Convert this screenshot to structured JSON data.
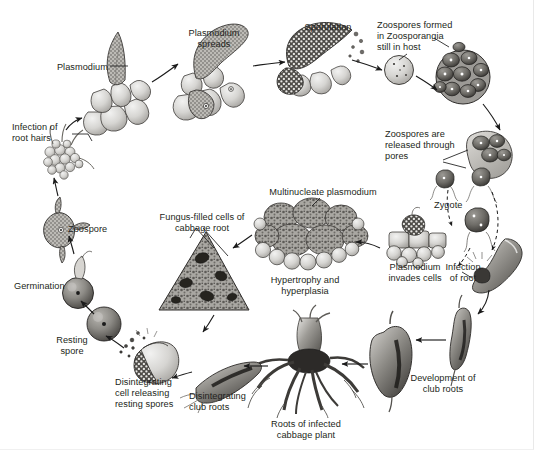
{
  "figure": {
    "background_color": "#ffffff",
    "text_color": "#231f20",
    "width": 534,
    "height": 450
  },
  "labels": [
    {
      "id": "plasmodium",
      "text": "Plasmodium",
      "x": 44,
      "y": 62,
      "w": 64,
      "align": "right"
    },
    {
      "id": "plasmodium-spreads",
      "text": "Plasmodium\nspreads",
      "x": 177,
      "y": 28,
      "w": 74,
      "align": "center"
    },
    {
      "id": "sporulation",
      "text": "Sporulation",
      "x": 298,
      "y": 22,
      "w": 60,
      "align": "center"
    },
    {
      "id": "zoospores-formed",
      "text": "Zoospores formed\nin Zoosporangia\nstill in host",
      "x": 377,
      "y": 20,
      "w": 88,
      "align": "left"
    },
    {
      "id": "infection-of-root-hairs",
      "text": "Infection of\nroot hairs",
      "x": 12,
      "y": 122,
      "w": 58,
      "align": "left"
    },
    {
      "id": "zoospores-released",
      "text": "Zoospores are\nreleased through\npores",
      "x": 385,
      "y": 129,
      "w": 90,
      "align": "left"
    },
    {
      "id": "zygote",
      "text": "Zygote",
      "x": 434,
      "y": 200,
      "w": 38,
      "align": "left"
    },
    {
      "id": "multinucleate",
      "text": "Multinucleate plasmodium",
      "x": 258,
      "y": 187,
      "w": 130,
      "align": "center"
    },
    {
      "id": "fungus-filled-cells",
      "text": "Fungus-filled cells of\ncabbage root",
      "x": 150,
      "y": 212,
      "w": 100,
      "align": "center"
    },
    {
      "id": "zoospore",
      "text": "Zoospore",
      "x": 68,
      "y": 224,
      "w": 50,
      "align": "left"
    },
    {
      "id": "hypertrophy",
      "text": "Hypertrophy and\nhyperplasia",
      "x": 261,
      "y": 275,
      "w": 86,
      "align": "center"
    },
    {
      "id": "plasmodium-invades",
      "text": "Plasmodium\ninvades cells",
      "x": 382,
      "y": 262,
      "w": 66,
      "align": "center"
    },
    {
      "id": "infection-of-root",
      "text": "Infection\nof root",
      "x": 441,
      "y": 262,
      "w": 42,
      "align": "center"
    },
    {
      "id": "germination",
      "text": "Germination",
      "x": 14,
      "y": 281,
      "w": 62,
      "align": "left"
    },
    {
      "id": "resting-spore",
      "text": "Resting\nspore",
      "x": 50,
      "y": 335,
      "w": 42,
      "align": "center"
    },
    {
      "id": "disintegrating-cell",
      "text": "Disintegrating\ncell releasing\nresting spores",
      "x": 115,
      "y": 377,
      "w": 76,
      "align": "left"
    },
    {
      "id": "disintegrating-club",
      "text": "Disintegrating\nclub roots",
      "x": 189,
      "y": 391,
      "w": 72,
      "align": "left"
    },
    {
      "id": "roots-of-infected",
      "text": "Roots of infected\ncabbage plant",
      "x": 258,
      "y": 419,
      "w": 96,
      "align": "center"
    },
    {
      "id": "development-of-club",
      "text": "Development of\nclub roots",
      "x": 399,
      "y": 373,
      "w": 84,
      "align": "center"
    }
  ],
  "stages": [
    {
      "id": "root-hair-cluster",
      "name": "infected-root-hair-cluster"
    },
    {
      "id": "plasmodium-in-cells",
      "name": "plasmodium-in-root-cells"
    },
    {
      "id": "plasmodium-spreading",
      "name": "plasmodium-spreading-in-cells"
    },
    {
      "id": "sporulating-mass",
      "name": "sporulating-plasmodium"
    },
    {
      "id": "zoosporangium-single",
      "name": "single-zoosporangium"
    },
    {
      "id": "zoosporangia-cluster",
      "name": "zoosporangia-cluster"
    },
    {
      "id": "zoospore-release",
      "name": "zoospore-release-through-pores"
    },
    {
      "id": "zygote-cell",
      "name": "zygote"
    },
    {
      "id": "root-tip-infection",
      "name": "root-tip-infection-site"
    },
    {
      "id": "club-root-young",
      "name": "young-club-root"
    },
    {
      "id": "club-root-mature",
      "name": "mature-club-root"
    },
    {
      "id": "cabbage-root-system",
      "name": "infected-cabbage-root-system"
    },
    {
      "id": "club-root-decaying",
      "name": "disintegrating-club-root"
    },
    {
      "id": "disintegrating-cell-art",
      "name": "disintegrating-cell-releasing-spores"
    },
    {
      "id": "resting-spore-art",
      "name": "resting-spore"
    },
    {
      "id": "germinating-spore",
      "name": "germinating-resting-spore"
    },
    {
      "id": "zoospore-art",
      "name": "motile-zoospore"
    },
    {
      "id": "cabbage-root-section",
      "name": "cabbage-root-cross-section"
    },
    {
      "id": "multinucleate-mass",
      "name": "multinucleate-plasmodium-mass"
    },
    {
      "id": "invaded-cells",
      "name": "plasmodium-invading-cells"
    }
  ],
  "arrows": {
    "count": 18,
    "style": "solid black arrows with two dashed zoospore-swimming paths"
  }
}
